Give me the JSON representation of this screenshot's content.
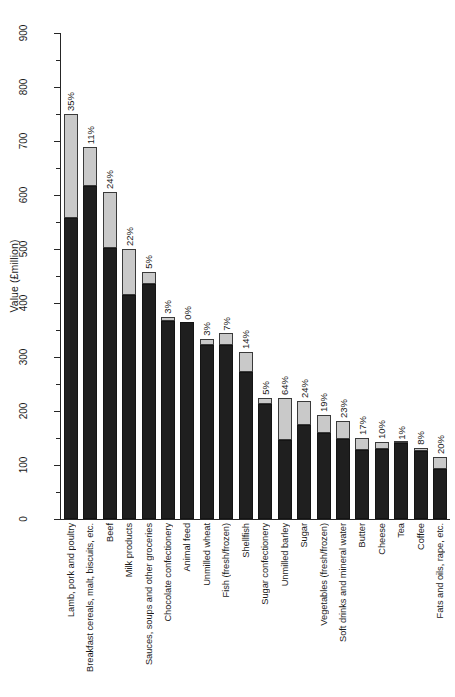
{
  "chart_data": {
    "type": "bar",
    "title": "",
    "subtitle": "",
    "xlabel": "",
    "ylabel": "Value (£million)",
    "ylim": [
      0,
      900
    ],
    "ytick_labels": [
      "0",
      "100",
      "200",
      "300",
      "400",
      "500",
      "600",
      "700",
      "800",
      "900"
    ],
    "ytick_values": [
      0,
      100,
      200,
      300,
      400,
      500,
      600,
      700,
      800,
      900
    ],
    "minor_ticks": true,
    "grid": false,
    "legend": [],
    "stacked": true,
    "orientation": "vertical",
    "categories": [
      "Lamb, pork and poultry",
      "Breakfast cereals, malt, biscuits, etc.",
      "Beef",
      "Milk products",
      "Sauces, soups and other groceries",
      "Chocolate confectionery",
      "Animal feed",
      "Unmilled wheat",
      "Fish (fresh/frozen)",
      "Shellfish",
      "Sugar confectionery",
      "Unmilled barley",
      "Sugar",
      "Vegetables (fresh/frozen)",
      "Soft drinks and mineral water",
      "Butter",
      "Cheese",
      "Tea",
      "Coffee",
      "Fats and oils, rape, etc."
    ],
    "series": [
      {
        "name": "Lower segment",
        "color": "#1f1f1f",
        "values": [
          557,
          617,
          502,
          415,
          435,
          367,
          364,
          322,
          322,
          272,
          213,
          146,
          174,
          160,
          148,
          128,
          130,
          140,
          126,
          92
        ]
      },
      {
        "name": "Upper segment",
        "color": "#c9c9c9",
        "values": [
          193,
          72,
          103,
          85,
          23,
          8,
          0,
          12,
          22,
          38,
          11,
          78,
          44,
          33,
          34,
          22,
          13,
          1,
          6,
          23
        ]
      }
    ],
    "totals": [
      750,
      689,
      605,
      500,
      458,
      375,
      364,
      334,
      344,
      310,
      224,
      224,
      218,
      193,
      182,
      150,
      143,
      141,
      132,
      115
    ],
    "annotations": [
      "35%",
      "11%",
      "24%",
      "22%",
      "5%",
      "3%",
      "0%",
      "3%",
      "7%",
      "14%",
      "5%",
      "64%",
      "24%",
      "19%",
      "23%",
      "17%",
      "10%",
      "1%",
      "8%",
      "20%"
    ]
  }
}
